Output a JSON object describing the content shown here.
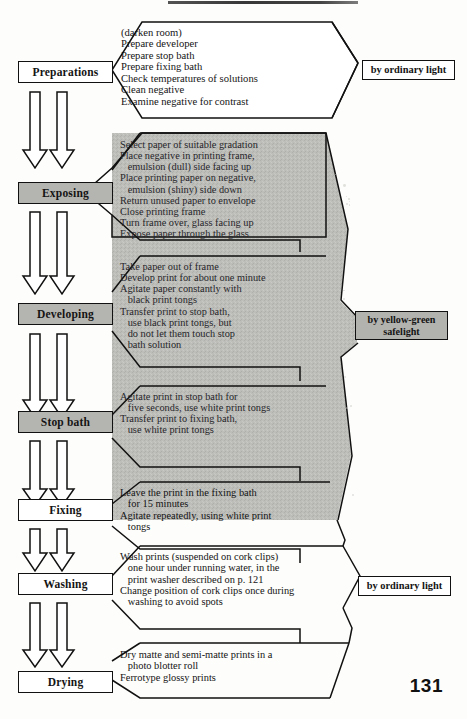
{
  "page": {
    "page_number": "131",
    "top_rule": "dark-header-rule"
  },
  "diagram": {
    "shade_color": "#b9b9b5",
    "line_color": "#111111",
    "stages": [
      {
        "id": "preparations",
        "label": "Preparations",
        "shaded": false,
        "lines": [
          "(darken room)",
          "Prepare developer",
          "Prepare stop bath",
          "Prepare fixing bath",
          "Check temperatures of solutions",
          "Clean negative",
          "Examine negative for contrast"
        ]
      },
      {
        "id": "exposing",
        "label": "Exposing",
        "shaded": true,
        "lines": [
          "Select paper of suitable gradation",
          "Place negative in printing frame,",
          "   emulsion (dull) side facing up",
          "Place printing paper on negative,",
          "   emulsion (shiny) side down",
          "Return unused paper to envelope",
          "Close printing frame",
          "Turn frame over, glass facing up",
          "Expose paper through the glass"
        ]
      },
      {
        "id": "developing",
        "label": "Developing",
        "shaded": true,
        "lines": [
          "Take paper out of frame",
          "Develop print for about one minute",
          "Agitate paper constantly with",
          "   black print tongs",
          "Transfer print to stop bath,",
          "   use black print tongs, but",
          "   do not let them touch stop",
          "   bath solution"
        ]
      },
      {
        "id": "stop-bath",
        "label": "Stop bath",
        "shaded": true,
        "lines": [
          "Agitate print in stop bath for",
          "   five seconds, use white print tongs",
          "Transfer print to fixing bath,",
          "   use white print tongs"
        ]
      },
      {
        "id": "fixing",
        "label": "Fixing",
        "shaded": false,
        "lines": [
          "Leave the print in the fixing bath",
          "   for 15 minutes",
          "Agitate repeatedly, using white print",
          "   tongs"
        ]
      },
      {
        "id": "washing",
        "label": "Washing",
        "shaded": false,
        "lines": [
          "Wash prints (suspended on cork clips)",
          "   one hour under running water, in the",
          "   print washer described on p. 121",
          "Change position of cork clips once during",
          "   washing to avoid spots"
        ]
      },
      {
        "id": "drying",
        "label": "Drying",
        "shaded": false,
        "lines": [
          "Dry matte and semi-matte prints in a",
          "   photo blotter roll",
          "Ferrotype glossy prints"
        ]
      }
    ],
    "light_labels": [
      {
        "id": "light-top",
        "text": "by ordinary light",
        "shaded": false
      },
      {
        "id": "light-middle",
        "text": "by yellow-green\nsafelight",
        "shaded": true
      },
      {
        "id": "light-bottom",
        "text": "by ordinary light",
        "shaded": false
      }
    ],
    "arrows": [
      {
        "id": "arrow-preparations-to-exposing"
      },
      {
        "id": "arrow-exposing-to-developing"
      },
      {
        "id": "arrow-developing-to-stopbath"
      },
      {
        "id": "arrow-stopbath-to-fixing"
      },
      {
        "id": "arrow-fixing-to-washing"
      },
      {
        "id": "arrow-washing-to-drying"
      }
    ]
  }
}
